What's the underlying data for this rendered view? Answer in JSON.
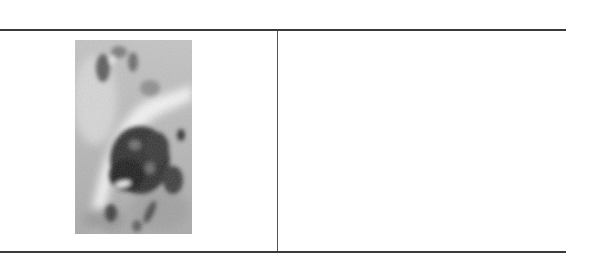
{
  "figure": {
    "table": {
      "columns": 2,
      "rows": 1,
      "cells": [
        {
          "content_type": "image",
          "image": {
            "description": "grayscale micrograph with dark stained cellular mass",
            "tone": "grayscale"
          }
        },
        {
          "content_type": "empty",
          "text": ""
        }
      ]
    },
    "colors": {
      "rule": "#3a3a3a",
      "divider": "#555555",
      "background": "#ffffff"
    }
  }
}
